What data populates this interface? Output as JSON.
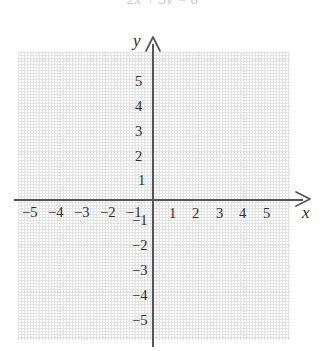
{
  "caption": {
    "fragment": "2x + 3y = 6"
  },
  "chart_data": {
    "type": "scatter",
    "title": "",
    "xlabel": "x",
    "ylabel": "y",
    "xlim": [
      -5.9,
      5.9
    ],
    "ylim": [
      -6.2,
      6.2
    ],
    "grid": true,
    "minor_grid": true,
    "legend": "none",
    "series": [],
    "x_ticks": [
      -5,
      -4,
      -3,
      -2,
      -1,
      1,
      2,
      3,
      4,
      5
    ],
    "y_ticks": [
      5,
      4,
      3,
      2,
      1,
      -1,
      -2,
      -3,
      -4,
      -5
    ],
    "x_tick_labels": [
      "−5",
      "−4",
      "−3",
      "−2",
      "−1",
      "1",
      "2",
      "3",
      "4",
      "5"
    ],
    "y_tick_labels": [
      "5",
      "4",
      "3",
      "2",
      "1",
      "−1",
      "−2",
      "−3",
      "−4",
      "−5"
    ],
    "annotations": []
  },
  "axes": {
    "x_name": "x",
    "y_name": "y",
    "x_arrow_icon": "arrow-right-icon",
    "y_arrow_icon": "arrow-up-icon"
  },
  "ticks": {
    "x_negative": [
      {
        "label": "−5",
        "left": 22
      },
      {
        "label": "−4",
        "left": 48
      },
      {
        "label": "−3",
        "left": 74
      },
      {
        "label": "−2",
        "left": 100
      },
      {
        "label": "−1",
        "left": 126
      }
    ],
    "x_positive": [
      {
        "label": "1",
        "left": 169
      },
      {
        "label": "2",
        "left": 192
      },
      {
        "label": "3",
        "left": 216
      },
      {
        "label": "4",
        "left": 239
      },
      {
        "label": "5",
        "left": 263
      }
    ],
    "y_positive": [
      {
        "label": "5",
        "left": 135,
        "top": 74
      },
      {
        "label": "4",
        "left": 135,
        "top": 99
      },
      {
        "label": "3",
        "left": 135,
        "top": 124
      },
      {
        "label": "2",
        "left": 135,
        "top": 149
      },
      {
        "label": "1",
        "left": 138,
        "top": 173
      }
    ],
    "y_negative": [
      {
        "label": "−1",
        "left": 132,
        "top": 213
      },
      {
        "label": "−2",
        "left": 132,
        "top": 238
      },
      {
        "label": "−3",
        "left": 132,
        "top": 263
      },
      {
        "label": "−4",
        "left": 132,
        "top": 288
      },
      {
        "label": "−5",
        "left": 132,
        "top": 313
      }
    ]
  },
  "colors": {
    "background": "#ffffff",
    "axis": "#555555",
    "grid_major": "#d6d6d6",
    "grid_minor": "#e8e8e8",
    "text": "#2b2b2b"
  }
}
